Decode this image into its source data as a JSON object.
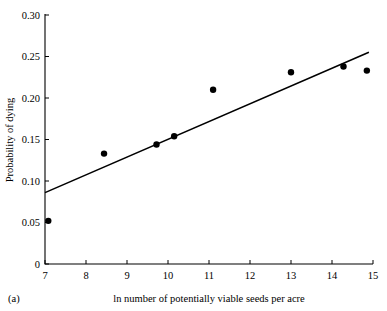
{
  "figure": {
    "panel_label": "(a)",
    "background_color": "#ffffff",
    "foreground_color": "#000000"
  },
  "chart_data": {
    "type": "scatter",
    "title": "",
    "subtitle": "",
    "xlabel": "ln number of potentially viable seeds per acre",
    "ylabel": "Probability of dying",
    "xlim": [
      7,
      15
    ],
    "ylim": [
      0,
      0.3
    ],
    "xticks": [
      7,
      8,
      9,
      10,
      11,
      12,
      13,
      14,
      15
    ],
    "xtick_labels": [
      "7",
      "8",
      "9",
      "10",
      "11",
      "12",
      "13",
      "14",
      "15"
    ],
    "yticks": [
      0,
      0.05,
      0.1,
      0.15,
      0.2,
      0.25,
      0.3
    ],
    "ytick_labels": [
      "0",
      "0.05",
      "0.10",
      "0.15",
      "0.20",
      "0.25",
      "0.30"
    ],
    "grid": false,
    "legend": false,
    "legend_position": "none",
    "marker_color": "#000000",
    "marker_shape": "circle",
    "marker_size": 3.2,
    "series": [
      {
        "name": "observations",
        "x": [
          7.08,
          8.44,
          9.72,
          10.15,
          11.1,
          13.0,
          14.28,
          14.85
        ],
        "y": [
          0.052,
          0.133,
          0.144,
          0.154,
          0.21,
          0.231,
          0.238,
          0.233
        ]
      }
    ],
    "fit_line": {
      "name": "regression line",
      "color": "#000000",
      "x_start": 7.0,
      "y_start": 0.086,
      "x_end": 14.9,
      "y_end": 0.255,
      "slope": 0.0214,
      "intercept": -0.064
    }
  }
}
